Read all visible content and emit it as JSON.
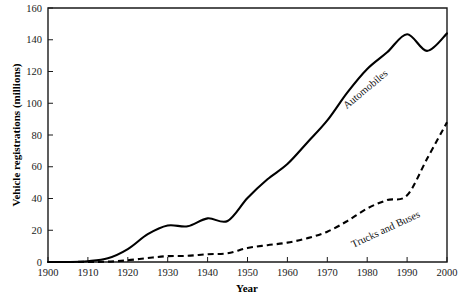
{
  "chart_data": {
    "type": "line",
    "title": "",
    "xlabel": "Year",
    "ylabel": "Vehicle registrations (millions)",
    "xlim": [
      1900,
      2000
    ],
    "ylim": [
      0,
      160
    ],
    "grid": false,
    "legend_position": "inline-annotations",
    "xticks": [
      1900,
      1910,
      1920,
      1930,
      1940,
      1950,
      1960,
      1970,
      1980,
      1990,
      2000
    ],
    "xtick_labels": [
      "1900",
      "1910",
      "1920",
      "1930",
      "1940",
      "1950",
      "1960",
      "1970",
      "1980",
      "1990",
      "2000"
    ],
    "yticks": [
      0,
      20,
      40,
      60,
      80,
      100,
      120,
      140,
      160
    ],
    "ytick_labels": [
      "0",
      "20",
      "40",
      "60",
      "80",
      "100",
      "120",
      "140",
      "160"
    ],
    "x": [
      1900,
      1905,
      1910,
      1915,
      1920,
      1925,
      1930,
      1935,
      1940,
      1945,
      1950,
      1955,
      1960,
      1965,
      1970,
      1975,
      1980,
      1985,
      1990,
      1995,
      2000
    ],
    "series": [
      {
        "name": "Automobiles",
        "style": "solid",
        "color": "#000000",
        "annotation": "Automobiles",
        "values": [
          0,
          0,
          0.5,
          2.3,
          8.1,
          17.5,
          23.0,
          22.5,
          27.5,
          25.8,
          40.3,
          52.1,
          61.7,
          75.3,
          89.2,
          106.7,
          121.6,
          132.1,
          143.5,
          133.0,
          144.0
        ]
      },
      {
        "name": "Trucks and Buses",
        "style": "dashed",
        "color": "#000000",
        "annotation": "Trucks and Buses",
        "values": [
          0,
          0,
          0.1,
          0.2,
          1.1,
          2.5,
          3.7,
          3.9,
          4.9,
          5.5,
          8.8,
          10.6,
          12.2,
          15.0,
          19.1,
          25.8,
          33.7,
          39.0,
          42.0,
          65.0,
          88.0
        ]
      }
    ]
  },
  "annotations": {
    "automobiles": {
      "text": "Automobiles",
      "rotation_deg": -40
    },
    "trucks_and_buses": {
      "text": "Trucks and Buses",
      "rotation_deg": -25
    }
  }
}
